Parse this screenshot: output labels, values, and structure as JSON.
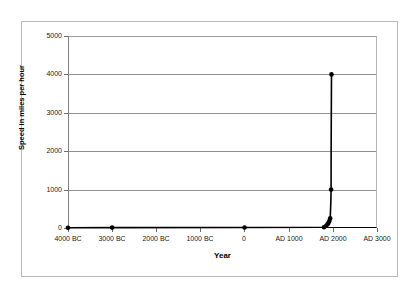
{
  "chart_data": {
    "type": "line",
    "title": "",
    "xlabel": "Year",
    "ylabel": "Speed in miles per hour",
    "ylim": [
      0,
      5000
    ],
    "xlim": [
      -4000,
      3000
    ],
    "grid": true,
    "legend": false,
    "marker": "filled-circle",
    "line_color": "#000000",
    "grid_color": "#8f8f8f",
    "y_ticks": [
      0,
      1000,
      2000,
      3000,
      4000,
      5000
    ],
    "y_tick_labels": [
      "0",
      "1000",
      "2000",
      "3000",
      "4000",
      "5000"
    ],
    "x_ticks": [
      -4000,
      -3000,
      -2000,
      -1000,
      0,
      1000,
      2000,
      3000
    ],
    "x_tick_labels": [
      "4000 BC",
      "3000 BC",
      "2000 BC",
      "1000 BC",
      "0",
      "AD 1000",
      "AD 2000",
      "AD 3000"
    ],
    "series": [
      {
        "name": "Maximum human travel speed",
        "x": [
          -4000,
          -3000,
          0,
          1800,
          1850,
          1880,
          1900,
          1920,
          1940,
          1955,
          1960,
          1961,
          1969
        ],
        "y": [
          5,
          10,
          12,
          20,
          60,
          100,
          130,
          180,
          250,
          700,
          1000,
          2000,
          4000
        ],
        "marker_points": [
          {
            "x": -4000,
            "y": 5
          },
          {
            "x": -3000,
            "y": 10
          },
          {
            "x": 0,
            "y": 12
          },
          {
            "x": 1800,
            "y": 20
          },
          {
            "x": 1850,
            "y": 60
          },
          {
            "x": 1880,
            "y": 100
          },
          {
            "x": 1900,
            "y": 130
          },
          {
            "x": 1920,
            "y": 180
          },
          {
            "x": 1940,
            "y": 250
          },
          {
            "x": 1960,
            "y": 1000
          },
          {
            "x": 1969,
            "y": 4000
          }
        ]
      }
    ],
    "annotations": []
  },
  "axes": {
    "y_title": "Speed in miles per hour",
    "x_title": "Year"
  }
}
